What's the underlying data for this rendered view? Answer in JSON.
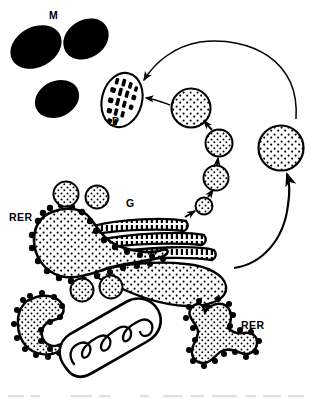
{
  "figure": {
    "kind": "cell-organelle-diagram",
    "title_visible": false,
    "background_color": "#ffffff",
    "ink_color": "#000000",
    "labels": [
      {
        "id": "M",
        "text": "M",
        "refers_to": "melanosome",
        "x": 49,
        "y": 10
      },
      {
        "id": "P",
        "text": "P",
        "refers_to": "premelanosome",
        "x": 112,
        "y": 116
      },
      {
        "id": "G",
        "text": "G",
        "refers_to": "golgi-apparatus",
        "x": 126,
        "y": 198
      },
      {
        "id": "RER1",
        "text": "RER",
        "refers_to": "rough-endoplasmic-reticulum",
        "x": 9,
        "y": 212
      },
      {
        "id": "RER2",
        "text": "RER",
        "refers_to": "rough-endoplasmic-reticulum",
        "x": 241,
        "y": 320
      }
    ],
    "melanosomes": [
      {
        "cx": 35,
        "cy": 46,
        "rx": 26,
        "ry": 19,
        "rot": -28
      },
      {
        "cx": 85,
        "cy": 38,
        "rx": 23,
        "ry": 18,
        "rot": -30
      },
      {
        "cx": 56,
        "cy": 98,
        "rx": 22,
        "ry": 17,
        "rot": -26
      }
    ],
    "premelanosome": {
      "cx": 122,
      "cy": 100,
      "rx": 20,
      "ry": 27,
      "rot": 16,
      "internal_pattern": "dashed-rows",
      "rows": 4
    },
    "transport_vesicles": [
      {
        "cx": 191,
        "cy": 108,
        "r": 19,
        "fill": "stipple"
      },
      {
        "cx": 218,
        "cy": 143,
        "r": 13,
        "fill": "stipple"
      },
      {
        "cx": 215,
        "cy": 178,
        "r": 12,
        "fill": "stipple"
      },
      {
        "cx": 204,
        "cy": 206,
        "r": 8,
        "fill": "stipple"
      },
      {
        "cx": 280,
        "cy": 148,
        "r": 22,
        "fill": "stipple"
      }
    ],
    "free_vesicles": [
      {
        "cx": 66,
        "cy": 194,
        "r": 12
      },
      {
        "cx": 96,
        "cy": 197,
        "r": 11
      },
      {
        "cx": 81,
        "cy": 290,
        "r": 11
      },
      {
        "cx": 110,
        "cy": 287,
        "r": 11
      }
    ],
    "golgi": {
      "cisternae": 4,
      "note": "stacked curved saccules; lowest dilates into stippled cisterna"
    },
    "rer_bodies": [
      {
        "id": "rer-main",
        "shape": "tadpole",
        "ribosomes": true,
        "fill": "stipple"
      },
      {
        "id": "rer-left",
        "shape": "crescent",
        "ribosomes": true,
        "fill": "stipple"
      },
      {
        "id": "rer-right",
        "shape": "trilobed",
        "ribosomes": true,
        "fill": "stipple"
      }
    ],
    "mitochondrion": {
      "cx": 98,
      "cy": 355,
      "note": "zigzag inner cristae membrane"
    },
    "arrows": [
      {
        "id": "arrow-recycle-top",
        "from": "right-vesicle",
        "to": "premelanosome",
        "style": "curved"
      },
      {
        "id": "arrow-vesicle-to-p",
        "from": "vesicle-1",
        "to": "premelanosome",
        "style": "straight"
      },
      {
        "id": "arrow-chain-4-3",
        "from": "vesicle-2",
        "to": "vesicle-1",
        "style": "short"
      },
      {
        "id": "arrow-chain-3-2",
        "from": "vesicle-3",
        "to": "vesicle-2",
        "style": "short"
      },
      {
        "id": "arrow-chain-2-1",
        "from": "vesicle-4",
        "to": "vesicle-3",
        "style": "short"
      },
      {
        "id": "arrow-golgi-to-chain",
        "from": "golgi",
        "to": "vesicle-4",
        "style": "short"
      },
      {
        "id": "arrow-recycle-bottom",
        "from": "golgi-region",
        "to": "right-vesicle",
        "style": "curved"
      }
    ]
  }
}
